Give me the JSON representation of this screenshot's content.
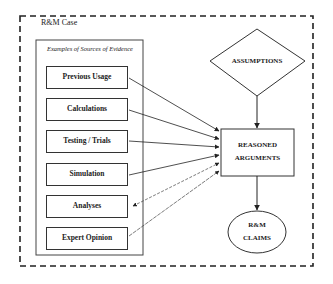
{
  "outer_container": {
    "label": "R&M Case"
  },
  "evidence_group": {
    "label": "Examples of Sources of Evidence",
    "items": [
      {
        "label": "Previous Usage"
      },
      {
        "label": "Calculations"
      },
      {
        "label": "Testing / Trials"
      },
      {
        "label": "Simulation"
      },
      {
        "label": "Analyses"
      },
      {
        "label": "Expert Opinion"
      }
    ]
  },
  "assumptions": {
    "label": "ASSUMPTIONS"
  },
  "reasoned_arguments": {
    "line1": "REASONED",
    "line2": "ARGUMENTS"
  },
  "claims": {
    "line1": "R&M",
    "line2": "CLAIMS"
  },
  "colors": {
    "stroke": "#333333",
    "background": "#ffffff"
  }
}
